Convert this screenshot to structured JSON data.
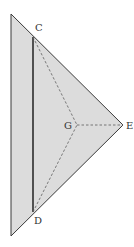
{
  "diagram": {
    "labels": {
      "C": "C",
      "D": "D",
      "E": "E",
      "G": "G"
    },
    "colors": {
      "fill": "#dcdcdc",
      "stroke": "#3a3a3a",
      "dashed": "#6a6a6a",
      "background": "#ffffff"
    },
    "points": {
      "top": [
        11,
        14
      ],
      "bottom": [
        11,
        236
      ],
      "C": [
        33,
        37
      ],
      "D": [
        33,
        212
      ],
      "E": [
        123,
        125
      ],
      "G": [
        77,
        125
      ]
    }
  }
}
